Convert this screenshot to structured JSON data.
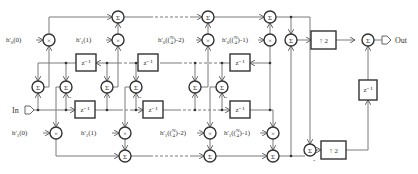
{
  "diagram": {
    "type": "polyphase filter block diagram",
    "input_label": "In",
    "output_label": "Out",
    "sum_symbol": "Σ",
    "mult_symbol": "×",
    "delay_label": "z⁻¹",
    "upsample_label": "↑ 2",
    "minus_sign": "-",
    "coefficients_top": [
      "h'0(0)",
      "h'0(1)",
      "h'0([N/4]-2)",
      "h'0([N/4]-1)"
    ],
    "coefficients_bottom": [
      "h'1(0)",
      "h'1(1)",
      "h'1([N/4]-2)",
      "h'1([N/4]-1)"
    ],
    "labels": {
      "h0_0": "h'",
      "h0_0_sub": "0",
      "h0_0_arg": "(0)",
      "h0_1": "h'",
      "h0_1_sub": "0",
      "h0_1_arg": "(1)",
      "h0_n2_arg": "-2)",
      "h0_n1_arg": "-1)",
      "h1_0_arg": "(0)",
      "h1_1_arg": "(1)",
      "h1_n2_arg": "-2)",
      "h1_n1_arg": "-1)",
      "frac_n": "N",
      "frac_d": "4",
      "prime_h": "h'",
      "sub0": "0",
      "sub1": "1"
    }
  }
}
